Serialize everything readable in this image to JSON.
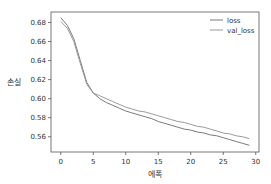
{
  "chart_data": {
    "type": "line",
    "title": "",
    "xlabel": "에폭",
    "ylabel": "손실",
    "xlim": [
      -1.5,
      30.5
    ],
    "ylim": [
      0.544,
      0.691
    ],
    "xticks": [
      0,
      5,
      10,
      15,
      20,
      25,
      30
    ],
    "yticks": [
      0.56,
      0.58,
      0.6,
      0.62,
      0.64,
      0.66,
      0.68
    ],
    "ytick_labels": [
      "0.56",
      "0.58",
      "0.60",
      "0.62",
      "0.64",
      "0.66",
      "0.68"
    ],
    "legend_position": "upper right",
    "grid": false,
    "x": [
      0,
      1,
      2,
      3,
      4,
      5,
      6,
      7,
      8,
      9,
      10,
      11,
      12,
      13,
      14,
      15,
      16,
      17,
      18,
      19,
      20,
      21,
      22,
      23,
      24,
      25,
      26,
      27,
      28,
      29
    ],
    "series": [
      {
        "name": "loss",
        "color": "#7a7a7a",
        "values": [
          0.685,
          0.677,
          0.663,
          0.64,
          0.617,
          0.606,
          0.6,
          0.596,
          0.593,
          0.59,
          0.587,
          0.585,
          0.583,
          0.581,
          0.579,
          0.576,
          0.574,
          0.572,
          0.57,
          0.568,
          0.567,
          0.565,
          0.564,
          0.562,
          0.561,
          0.559,
          0.557,
          0.555,
          0.553,
          0.551
        ]
      },
      {
        "name": "val_loss",
        "color": "#9a9a9a",
        "values": [
          0.681,
          0.674,
          0.66,
          0.637,
          0.615,
          0.606,
          0.603,
          0.6,
          0.597,
          0.594,
          0.591,
          0.589,
          0.587,
          0.586,
          0.584,
          0.582,
          0.58,
          0.578,
          0.576,
          0.575,
          0.573,
          0.571,
          0.57,
          0.568,
          0.566,
          0.564,
          0.563,
          0.561,
          0.56,
          0.558
        ]
      }
    ]
  }
}
